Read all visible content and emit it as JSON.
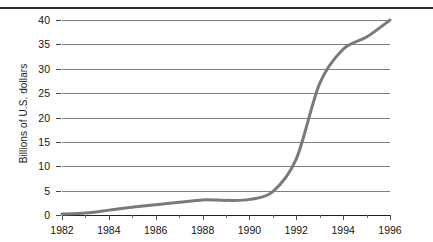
{
  "chart_data": {
    "type": "line",
    "title": "",
    "xlabel": "",
    "ylabel": "Billions of U.S. dollars",
    "xlim": [
      1982,
      1996
    ],
    "ylim": [
      0,
      40
    ],
    "grid": true,
    "legend": false,
    "line_color": "#7a7a7a",
    "x": [
      1982,
      1983,
      1984,
      1985,
      1986,
      1987,
      1988,
      1989,
      1990,
      1991,
      1992,
      1993,
      1994,
      1995,
      1996
    ],
    "values": [
      0.2,
      0.4,
      1.0,
      1.6,
      2.1,
      2.6,
      3.1,
      3.0,
      3.2,
      4.8,
      11.5,
      27.0,
      34.0,
      36.5,
      40.0
    ],
    "series": [
      {
        "name": "Billions of U.S. dollars",
        "values": [
          0.2,
          0.4,
          1.0,
          1.6,
          2.1,
          2.6,
          3.1,
          3.0,
          3.2,
          4.8,
          11.5,
          27.0,
          34.0,
          36.5,
          40.0
        ]
      }
    ],
    "yticks": [
      0,
      5,
      10,
      15,
      20,
      25,
      30,
      35,
      40
    ],
    "ytick_labels": [
      "0",
      "5",
      "10",
      "15",
      "20",
      "25",
      "30",
      "35",
      "40"
    ],
    "xticks": [
      1982,
      1984,
      1986,
      1988,
      1990,
      1992,
      1994,
      1996
    ],
    "xtick_labels": [
      "1982",
      "1984",
      "1986",
      "1988",
      "1990",
      "1992",
      "1994",
      "1996"
    ],
    "xticks_minor": [
      1983,
      1985,
      1987,
      1989,
      1991,
      1993,
      1995
    ]
  }
}
